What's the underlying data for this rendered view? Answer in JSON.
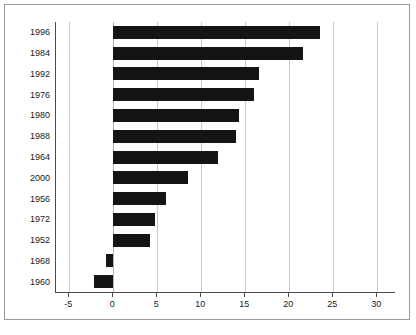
{
  "chart_data": {
    "type": "bar",
    "orientation": "horizontal",
    "title": "",
    "xlabel": "",
    "ylabel": "Year",
    "xlim": [
      -6.5,
      32
    ],
    "xticks": [
      -5,
      0,
      5,
      10,
      15,
      20,
      25,
      30
    ],
    "xticklabels": [
      "-5",
      "0",
      "5",
      "10",
      "15",
      "20",
      "25",
      "30"
    ],
    "grid": true,
    "grid_axis": "x",
    "legend": false,
    "bar_color": "#141414",
    "categories": [
      "1996",
      "1984",
      "1992",
      "1976",
      "1980",
      "1988",
      "1964",
      "2000",
      "1956",
      "1972",
      "1952",
      "1968",
      "1960"
    ],
    "values": [
      23.5,
      21.5,
      16.5,
      16.0,
      14.3,
      14.0,
      11.9,
      8.5,
      6.0,
      4.8,
      4.2,
      -0.8,
      -2.2
    ],
    "bars": [
      {
        "category": "1996",
        "value": 23.5
      },
      {
        "category": "1984",
        "value": 21.5
      },
      {
        "category": "1992",
        "value": 16.5
      },
      {
        "category": "1976",
        "value": 16.0
      },
      {
        "category": "1980",
        "value": 14.3
      },
      {
        "category": "1988",
        "value": 14.0
      },
      {
        "category": "1964",
        "value": 11.9
      },
      {
        "category": "2000",
        "value": 8.5
      },
      {
        "category": "1956",
        "value": 6.0
      },
      {
        "category": "1972",
        "value": 4.8
      },
      {
        "category": "1952",
        "value": 4.2
      },
      {
        "category": "1968",
        "value": -0.8
      },
      {
        "category": "1960",
        "value": -2.2
      }
    ]
  }
}
